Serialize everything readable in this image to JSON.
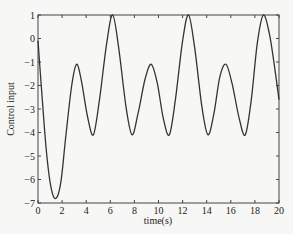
{
  "chart_data": {
    "type": "line",
    "title": "",
    "xlabel": "time(s)",
    "ylabel": "Control input",
    "xlim": [
      0,
      20
    ],
    "ylim": [
      -7,
      1
    ],
    "xticks": [
      0,
      2,
      4,
      6,
      8,
      10,
      12,
      14,
      16,
      18,
      20
    ],
    "yticks": [
      1,
      0,
      -1,
      -2,
      -3,
      -4,
      -5,
      -6,
      -7
    ],
    "grid": false,
    "legend": null,
    "series": [
      {
        "name": "Control input",
        "color": "#333333",
        "x": [
          0,
          0.3,
          0.7,
          1.1,
          1.5,
          1.9,
          2.3,
          2.8,
          3.2,
          3.6,
          4.1,
          4.6,
          5.1,
          5.7,
          6.2,
          6.7,
          7.3,
          7.8,
          8.3,
          8.9,
          9.4,
          9.9,
          10.4,
          10.9,
          11.4,
          12.0,
          12.5,
          13.0,
          13.6,
          14.1,
          14.6,
          15.1,
          15.6,
          16.1,
          16.7,
          17.2,
          17.7,
          18.2,
          18.7,
          19.2,
          19.6,
          20.0
        ],
        "y": [
          -0.1,
          -2.2,
          -4.8,
          -6.4,
          -6.8,
          -6.1,
          -4.2,
          -2.0,
          -1.1,
          -1.8,
          -3.3,
          -4.1,
          -2.6,
          -0.2,
          1.0,
          -0.4,
          -2.9,
          -4.1,
          -3.2,
          -1.7,
          -1.1,
          -1.9,
          -3.4,
          -4.1,
          -2.6,
          -0.1,
          1.0,
          -0.4,
          -2.9,
          -4.1,
          -3.2,
          -1.6,
          -1.1,
          -1.9,
          -3.4,
          -4.1,
          -2.6,
          -0.2,
          1.0,
          0.2,
          -1.1,
          -2.6
        ]
      }
    ]
  }
}
